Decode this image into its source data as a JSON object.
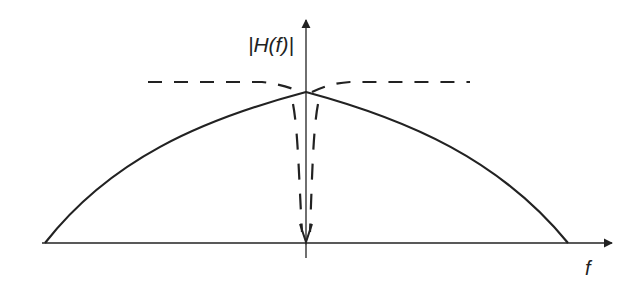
{
  "diagram": {
    "title": "",
    "y_axis_label": "|H(f)|",
    "x_axis_label": "f",
    "colors": {
      "ink": "#222222",
      "background": "#ffffff"
    },
    "curves": [
      {
        "name": "filter-response",
        "style": "solid",
        "description": "Smooth low-pass-like magnitude response peaking at f = 0"
      },
      {
        "name": "ideal-response-with-notch",
        "style": "dashed",
        "description": "Flat response with a narrow notch dipping to zero at f = 0"
      }
    ]
  }
}
